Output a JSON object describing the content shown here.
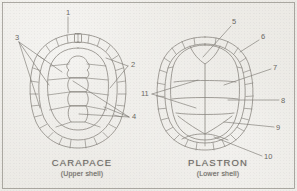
{
  "figure": {
    "background_color": "#e9e7e2",
    "ink_color": "#8a8781",
    "border": true
  },
  "panels": [
    {
      "id": "carapace",
      "name": "CARAPACE",
      "subtitle": "(Upper shell)",
      "position": "left"
    },
    {
      "id": "plastron",
      "name": "PLASTRON",
      "subtitle": "(Lower shell)",
      "position": "right"
    }
  ],
  "callouts": {
    "carapace": [
      {
        "number": "1",
        "x": 67,
        "y": 11
      },
      {
        "number": "2",
        "x": 131,
        "y": 64
      },
      {
        "number": "3",
        "x": 16,
        "y": 37
      },
      {
        "number": "4",
        "x": 132,
        "y": 115
      }
    ],
    "plastron": [
      {
        "number": "5",
        "x": 233,
        "y": 21
      },
      {
        "number": "6",
        "x": 262,
        "y": 37
      },
      {
        "number": "7",
        "x": 274,
        "y": 66
      },
      {
        "number": "8",
        "x": 282,
        "y": 99
      },
      {
        "number": "9",
        "x": 277,
        "y": 126
      },
      {
        "number": "10",
        "x": 266,
        "y": 155
      },
      {
        "number": "11",
        "x": 143,
        "y": 92
      }
    ]
  },
  "leader_lines": {
    "carapace": [
      "1 vertical line down to nuchal scute",
      "3 fan of three lines to marginal, costal and vertebral scutes",
      "2 fan of two lines to marginal scutes",
      "4 fan of three lines to vertebral and costal scutes"
    ],
    "plastron": [
      "5 line to gular notch",
      "6 line to anterior marginal scute",
      "7 line to pectoral scute",
      "8 line to abdominal scute",
      "9 line to femoral scute",
      "10 line to anal scute",
      "11 fan of two lines to bridge and humeral scutes"
    ]
  }
}
